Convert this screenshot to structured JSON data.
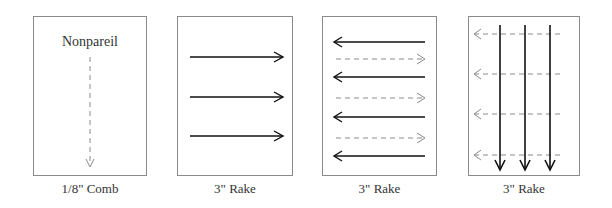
{
  "panels": [
    {
      "caption": "1/8\" Comb",
      "title": "Nonpareil",
      "pattern": "single dashed downward arrow"
    },
    {
      "caption": "3\" Rake",
      "pattern": "three solid rightward arrows"
    },
    {
      "caption": "3\" Rake",
      "pattern": "alternating solid leftward and dashed rightward arrows"
    },
    {
      "caption": "3\" Rake",
      "pattern": "three solid downward arrows over four dashed leftward arrows"
    }
  ],
  "colors": {
    "solid_arrow": "#111111",
    "dashed_arrow": "#8a8a8a",
    "border": "#8a8a8a"
  }
}
